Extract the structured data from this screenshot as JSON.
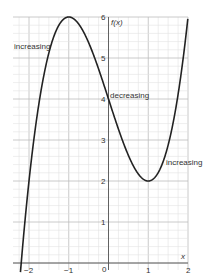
{
  "chart_data": {
    "type": "line",
    "title": "",
    "function": "f(x) = x^3 - 3x + 4",
    "xlabel": "x",
    "ylabel": "f(x)",
    "xlim": [
      -2.25,
      2
    ],
    "ylim": [
      -0.2,
      6
    ],
    "x_ticks": [
      "-2",
      "-1",
      "0",
      "1",
      "2"
    ],
    "y_ticks": [
      "1",
      "2",
      "3",
      "4",
      "5",
      "6"
    ],
    "grid": true,
    "series": [
      {
        "name": "f(x)",
        "x": [
          -2.2,
          -2,
          -1.5,
          -1,
          -0.5,
          0,
          0.5,
          1,
          1.5,
          2
        ],
        "values": [
          -0.05,
          2,
          5.125,
          6,
          5.375,
          4,
          2.625,
          2,
          3.875,
          6
        ]
      }
    ],
    "annotations": [
      {
        "text": "increasing",
        "x": -2.2,
        "y": 5.3
      },
      {
        "text": "decreasing",
        "x": 0.05,
        "y": 4.05
      },
      {
        "text": "increasing",
        "x": 1.45,
        "y": 2.55
      }
    ],
    "key_points": {
      "local_max": [
        -1,
        6
      ],
      "local_min": [
        1,
        2
      ],
      "y_intercept": [
        0,
        4
      ]
    }
  },
  "labels": {
    "y_axis": "f(x)",
    "x_axis": "x",
    "origin": "0",
    "ann1": "increasing",
    "ann2": "decreasing",
    "ann3": "increasing",
    "xt_m2": "−2",
    "xt_m1": "−1",
    "xt_1": "1",
    "xt_2": "2",
    "yt_1": "1",
    "yt_2": "2",
    "yt_3": "3",
    "yt_4": "4",
    "yt_5": "5",
    "yt_6": "6"
  }
}
